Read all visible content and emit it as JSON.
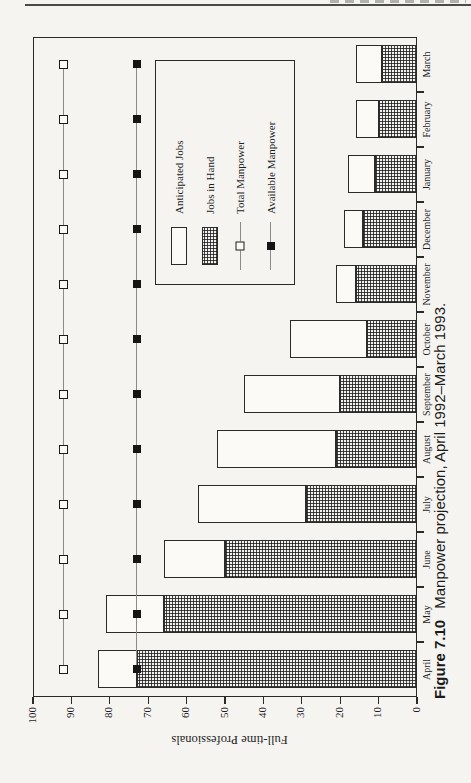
{
  "figure": {
    "label": "Figure 7.10",
    "caption": "Manpower projection, April 1992–March 1993."
  },
  "chart_data": {
    "type": "bar",
    "subtype": "stacked-horizontal-on-page (landscape chart rotated 90° CCW on portrait page)",
    "title": "",
    "xlabel": "",
    "ylabel": "Full-time Professionals",
    "ylim": [
      0,
      100
    ],
    "yticks": [
      0,
      10,
      20,
      30,
      40,
      50,
      60,
      70,
      80,
      90,
      100
    ],
    "grid": false,
    "legend_position": "inside-plot",
    "categories": [
      "April",
      "May",
      "June",
      "July",
      "August",
      "September",
      "October",
      "November",
      "December",
      "January",
      "February",
      "March"
    ],
    "series": [
      {
        "name": "Anticipated Jobs",
        "type": "bar",
        "stack": "top",
        "style": "open-white",
        "values": [
          10,
          15,
          16,
          28,
          31,
          25,
          20,
          5,
          5,
          7,
          6,
          7
        ]
      },
      {
        "name": "Jobs in Hand",
        "type": "bar",
        "stack": "bottom",
        "style": "crosshatch",
        "values": [
          73,
          66,
          50,
          29,
          21,
          20,
          13,
          16,
          14,
          11,
          10,
          9
        ]
      },
      {
        "name": "Total Manpower",
        "type": "line",
        "marker": "open-square",
        "values": [
          92,
          92,
          92,
          92,
          92,
          92,
          92,
          92,
          92,
          92,
          92,
          92
        ]
      },
      {
        "name": "Available Manpower",
        "type": "line",
        "marker": "filled-square",
        "values": [
          73,
          73,
          73,
          73,
          73,
          73,
          73,
          73,
          73,
          73,
          73,
          73
        ]
      }
    ],
    "colors": {
      "ink": "#2a2a28",
      "paper": "#f5f4f1",
      "line_gray": "#8b8b89"
    }
  }
}
